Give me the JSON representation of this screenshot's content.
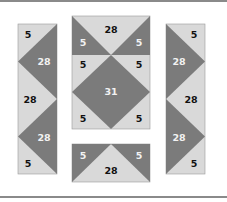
{
  "diagram": {
    "type": "quilt-piecing-layout",
    "colors": {
      "light": "#d9d9d9",
      "dark": "#7b7b7b",
      "outline": "#9a9a9a",
      "rule": "#8a8a8a",
      "text_on_light": "#111111",
      "text_on_dark": "#f2f2f2"
    },
    "left_strip": {
      "labels": [
        "5",
        "28",
        "28",
        "28",
        "5"
      ]
    },
    "center_block": {
      "labels": [
        "28",
        "5",
        "5",
        "5",
        "5",
        "31",
        "5",
        "5"
      ]
    },
    "bottom_block": {
      "labels": [
        "5",
        "5",
        "28"
      ]
    },
    "right_strip": {
      "labels": [
        "5",
        "28",
        "28",
        "28",
        "5"
      ]
    }
  }
}
